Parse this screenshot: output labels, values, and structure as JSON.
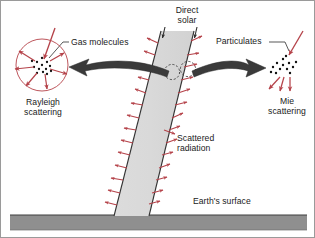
{
  "figure": {
    "background_color": "#ffffff",
    "border_color": "#9a9a9a"
  },
  "labels": {
    "direct_solar": "Direct\nsolar",
    "gas_molecules": "Gas molecules",
    "particulates": "Particulates",
    "rayleigh_scattering": "Rayleigh\nscattering",
    "mie_scattering": "Mie\nscattering",
    "scattered_radiation": "Scattered\nradiation",
    "earth_surface": "Earth's surface"
  },
  "colors": {
    "scatter_arrow": "#b5434a",
    "rayleigh_circle": "#b5434a",
    "beam_fill": "#d9d9d9",
    "beam_edge": "#333333",
    "ground_fill": "#8f8f8f",
    "ground_edge": "#4a4a4a",
    "pointer_arrow": "#3a3a3a",
    "leader_line": "#3a3a3a",
    "particle_dot": "#111111",
    "text": "#1a1a1a"
  },
  "elements": {
    "sun_beam": {
      "name": "direct solar beam",
      "description": "Slanted light-gray band of direct solar radiation descending from top of sky to the ground",
      "top_arrow_count": 2
    },
    "rayleigh_panel": {
      "name": "Rayleigh scattering diagram",
      "shape": "circle",
      "center_x": 41,
      "center_y": 64,
      "radius": 26,
      "molecule_dot_count": 13,
      "outgoing_arrow_count": 6,
      "incoming_arrow_count": 1,
      "pattern": "nearly symmetric omnidirectional scattering"
    },
    "mie_panel": {
      "name": "Mie scattering diagram",
      "shape": "dot cluster",
      "particle_dot_count": 13,
      "outgoing_arrow_count": 3,
      "incoming_arrow_count": 1,
      "pattern": "strong forward-directed scattering lobe"
    },
    "beam_molecules": {
      "name": "scattering particles in beam",
      "dashed_circle_count": 2
    },
    "scatter_arrows": {
      "name": "scattered radiation arrows",
      "count": 28,
      "description": "small red arrows radiating outward from both edges of the solar beam"
    },
    "ground": {
      "name": "Earth's surface band",
      "top_y": 214
    }
  }
}
